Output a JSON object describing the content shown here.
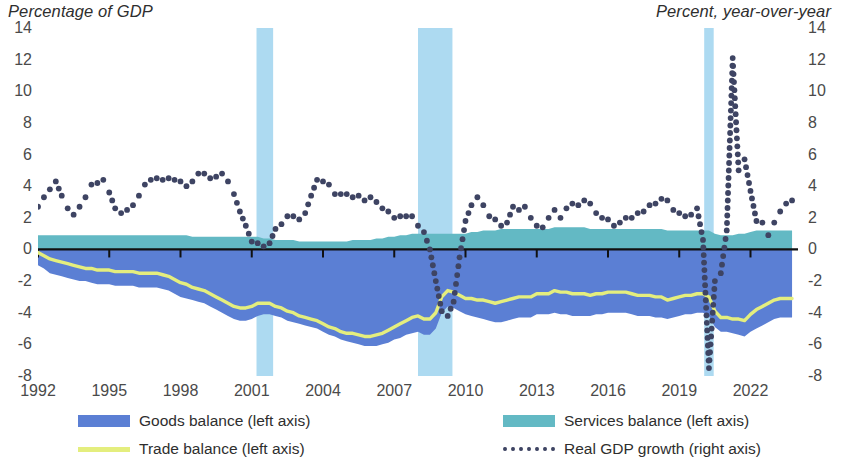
{
  "header": {
    "left_title": "Percentage of GDP",
    "right_title": "Percent, year-over-year"
  },
  "colors": {
    "goods": "#5b7fd4",
    "services": "#63b9c4",
    "trade_line": "#e4ee7e",
    "gdp_dots": "#3e4463",
    "recession": "#a9d8f0",
    "axis": "#111111",
    "text": "#4a4a4a"
  },
  "legend": {
    "items": [
      {
        "id": "goods-balance",
        "label": "Goods balance (left axis)",
        "swatch": "fill",
        "color": "#5b7fd4"
      },
      {
        "id": "trade-balance",
        "label": "Trade balance (left axis)",
        "swatch": "line",
        "color": "#e4ee7e"
      },
      {
        "id": "services-balance",
        "label": "Services balance (left axis)",
        "swatch": "fill",
        "color": "#63b9c4"
      },
      {
        "id": "real-gdp-growth",
        "label": "Real GDP growth (right axis)",
        "swatch": "dots",
        "color": "#3e4463"
      }
    ]
  },
  "chart_data": {
    "type": "area",
    "title": "",
    "xlabel": "",
    "ylabel": "Percentage of GDP",
    "ylabel_right": "Percent, year-over-year",
    "xlim": [
      1992,
      2024
    ],
    "ylim": [
      -8,
      14
    ],
    "ylim_right": [
      -8,
      14
    ],
    "yticks": [
      14,
      12,
      10,
      8,
      6,
      4,
      2,
      0,
      -2,
      -4,
      -6,
      -8
    ],
    "yticks_right": [
      14,
      12,
      10,
      8,
      6,
      4,
      2,
      0,
      -2,
      -4,
      -6,
      -8
    ],
    "xticks": [
      1992,
      1995,
      1998,
      2001,
      2004,
      2007,
      2010,
      2013,
      2016,
      2019,
      2022
    ],
    "grid": false,
    "legend_position": "bottom",
    "recession_bands": [
      {
        "start": 2001.2,
        "end": 2001.9
      },
      {
        "start": 2008.0,
        "end": 2009.45
      },
      {
        "start": 2020.05,
        "end": 2020.45
      }
    ],
    "x": [
      1992,
      1992.25,
      1992.5,
      1992.75,
      1993,
      1993.25,
      1993.5,
      1993.75,
      1994,
      1994.25,
      1994.5,
      1994.75,
      1995,
      1995.25,
      1995.5,
      1995.75,
      1996,
      1996.25,
      1996.5,
      1996.75,
      1997,
      1997.25,
      1997.5,
      1997.75,
      1998,
      1998.25,
      1998.5,
      1998.75,
      1999,
      1999.25,
      1999.5,
      1999.75,
      2000,
      2000.25,
      2000.5,
      2000.75,
      2001,
      2001.25,
      2001.5,
      2001.75,
      2002,
      2002.25,
      2002.5,
      2002.75,
      2003,
      2003.25,
      2003.5,
      2003.75,
      2004,
      2004.25,
      2004.5,
      2004.75,
      2005,
      2005.25,
      2005.5,
      2005.75,
      2006,
      2006.25,
      2006.5,
      2006.75,
      2007,
      2007.25,
      2007.5,
      2007.75,
      2008,
      2008.25,
      2008.5,
      2008.75,
      2009,
      2009.25,
      2009.5,
      2009.75,
      2010,
      2010.25,
      2010.5,
      2010.75,
      2011,
      2011.25,
      2011.5,
      2011.75,
      2012,
      2012.25,
      2012.5,
      2012.75,
      2013,
      2013.25,
      2013.5,
      2013.75,
      2014,
      2014.25,
      2014.5,
      2014.75,
      2015,
      2015.25,
      2015.5,
      2015.75,
      2016,
      2016.25,
      2016.5,
      2016.75,
      2017,
      2017.25,
      2017.5,
      2017.75,
      2018,
      2018.25,
      2018.5,
      2018.75,
      2019,
      2019.25,
      2019.5,
      2019.75,
      2020,
      2020.25,
      2020.5,
      2020.75,
      2021,
      2021.25,
      2021.5,
      2021.75,
      2022,
      2022.25,
      2022.5,
      2022.75,
      2023,
      2023.25,
      2023.5,
      2023.75
    ],
    "series": [
      {
        "name": "Goods balance (left axis)",
        "axis": "left",
        "type": "area",
        "color": "#5b7fd4",
        "values": [
          -1.0,
          -1.2,
          -1.5,
          -1.6,
          -1.7,
          -1.8,
          -1.9,
          -2.0,
          -2.0,
          -2.1,
          -2.2,
          -2.2,
          -2.2,
          -2.3,
          -2.3,
          -2.3,
          -2.3,
          -2.4,
          -2.4,
          -2.4,
          -2.4,
          -2.5,
          -2.6,
          -2.8,
          -3.0,
          -3.1,
          -3.2,
          -3.3,
          -3.4,
          -3.6,
          -3.8,
          -4.0,
          -4.2,
          -4.4,
          -4.5,
          -4.5,
          -4.4,
          -4.2,
          -4.1,
          -4.1,
          -4.2,
          -4.3,
          -4.5,
          -4.6,
          -4.7,
          -4.8,
          -4.9,
          -5.0,
          -5.2,
          -5.4,
          -5.5,
          -5.7,
          -5.8,
          -5.9,
          -6.0,
          -6.1,
          -6.1,
          -6.1,
          -6.0,
          -5.9,
          -5.7,
          -5.6,
          -5.4,
          -5.3,
          -5.2,
          -5.4,
          -5.4,
          -5.0,
          -4.0,
          -3.6,
          -3.7,
          -3.9,
          -4.1,
          -4.2,
          -4.3,
          -4.4,
          -4.5,
          -4.6,
          -4.6,
          -4.5,
          -4.4,
          -4.3,
          -4.3,
          -4.3,
          -4.1,
          -4.1,
          -4.1,
          -4.0,
          -4.1,
          -4.1,
          -4.2,
          -4.2,
          -4.2,
          -4.2,
          -4.1,
          -4.1,
          -4.0,
          -4.0,
          -4.0,
          -4.0,
          -4.1,
          -4.2,
          -4.2,
          -4.2,
          -4.3,
          -4.3,
          -4.4,
          -4.3,
          -4.2,
          -4.1,
          -4.1,
          -4.0,
          -4.0,
          -4.2,
          -4.9,
          -5.2,
          -5.2,
          -5.3,
          -5.4,
          -5.5,
          -5.2,
          -5.0,
          -4.8,
          -4.6,
          -4.4,
          -4.3,
          -4.3,
          -4.3
        ]
      },
      {
        "name": "Services balance (left axis)",
        "axis": "left",
        "type": "area",
        "color": "#63b9c4",
        "values": [
          0.9,
          0.9,
          0.9,
          0.9,
          0.9,
          0.9,
          0.9,
          0.9,
          0.9,
          0.9,
          0.9,
          0.9,
          0.9,
          0.9,
          0.9,
          0.9,
          0.9,
          0.9,
          0.9,
          0.9,
          0.9,
          0.9,
          0.9,
          0.9,
          0.9,
          0.9,
          0.8,
          0.8,
          0.8,
          0.8,
          0.8,
          0.8,
          0.8,
          0.8,
          0.8,
          0.8,
          0.8,
          0.8,
          0.7,
          0.7,
          0.6,
          0.6,
          0.6,
          0.6,
          0.5,
          0.5,
          0.5,
          0.5,
          0.5,
          0.5,
          0.5,
          0.5,
          0.5,
          0.6,
          0.6,
          0.6,
          0.6,
          0.7,
          0.7,
          0.8,
          0.8,
          0.9,
          0.9,
          1.0,
          1.0,
          1.0,
          1.0,
          1.0,
          1.0,
          1.0,
          1.0,
          1.0,
          1.0,
          1.1,
          1.1,
          1.2,
          1.2,
          1.2,
          1.3,
          1.3,
          1.3,
          1.3,
          1.3,
          1.3,
          1.3,
          1.3,
          1.3,
          1.4,
          1.4,
          1.4,
          1.4,
          1.4,
          1.4,
          1.3,
          1.3,
          1.3,
          1.3,
          1.3,
          1.3,
          1.3,
          1.3,
          1.3,
          1.3,
          1.3,
          1.3,
          1.3,
          1.2,
          1.2,
          1.2,
          1.2,
          1.2,
          1.2,
          1.2,
          1.2,
          1.0,
          0.9,
          0.9,
          0.9,
          1.0,
          1.0,
          1.1,
          1.2,
          1.2,
          1.2,
          1.2,
          1.2,
          1.2,
          1.2
        ]
      },
      {
        "name": "Trade balance (left axis)",
        "axis": "left",
        "type": "line",
        "color": "#e4ee7e",
        "values": [
          -0.2,
          -0.4,
          -0.6,
          -0.7,
          -0.8,
          -0.9,
          -1.0,
          -1.1,
          -1.2,
          -1.2,
          -1.3,
          -1.3,
          -1.3,
          -1.4,
          -1.4,
          -1.4,
          -1.4,
          -1.5,
          -1.5,
          -1.5,
          -1.5,
          -1.6,
          -1.7,
          -1.9,
          -2.1,
          -2.2,
          -2.4,
          -2.5,
          -2.6,
          -2.8,
          -3.0,
          -3.2,
          -3.4,
          -3.6,
          -3.7,
          -3.7,
          -3.6,
          -3.4,
          -3.4,
          -3.4,
          -3.6,
          -3.7,
          -3.9,
          -4.0,
          -4.2,
          -4.3,
          -4.4,
          -4.5,
          -4.7,
          -4.9,
          -5.0,
          -5.2,
          -5.3,
          -5.3,
          -5.4,
          -5.5,
          -5.5,
          -5.4,
          -5.3,
          -5.1,
          -4.9,
          -4.7,
          -4.5,
          -4.3,
          -4.2,
          -4.4,
          -4.4,
          -4.0,
          -3.0,
          -2.6,
          -2.7,
          -2.9,
          -3.1,
          -3.1,
          -3.2,
          -3.2,
          -3.3,
          -3.4,
          -3.3,
          -3.2,
          -3.1,
          -3.0,
          -3.0,
          -3.0,
          -2.8,
          -2.8,
          -2.8,
          -2.6,
          -2.7,
          -2.7,
          -2.8,
          -2.8,
          -2.8,
          -2.9,
          -2.8,
          -2.8,
          -2.7,
          -2.7,
          -2.7,
          -2.7,
          -2.8,
          -2.9,
          -2.9,
          -2.9,
          -3.0,
          -3.0,
          -3.2,
          -3.1,
          -3.0,
          -2.9,
          -2.9,
          -2.8,
          -2.8,
          -3.0,
          -3.9,
          -4.3,
          -4.3,
          -4.4,
          -4.4,
          -4.5,
          -4.1,
          -3.8,
          -3.6,
          -3.4,
          -3.2,
          -3.1,
          -3.1,
          -3.1
        ]
      },
      {
        "name": "Real GDP growth (right axis)",
        "axis": "right",
        "type": "scatter-dotted",
        "color": "#3e4463",
        "values": [
          2.7,
          3.3,
          3.8,
          4.3,
          3.4,
          2.6,
          2.2,
          2.7,
          3.3,
          4.1,
          4.2,
          4.4,
          3.6,
          2.6,
          2.3,
          2.5,
          2.8,
          3.4,
          4.1,
          4.4,
          4.5,
          4.4,
          4.5,
          4.4,
          4.3,
          4.0,
          4.3,
          4.8,
          4.8,
          4.5,
          4.6,
          4.8,
          4.3,
          3.5,
          2.4,
          1.5,
          0.5,
          0.4,
          0.2,
          0.4,
          1.3,
          1.6,
          2.1,
          2.1,
          1.9,
          2.3,
          3.4,
          4.4,
          4.3,
          4.1,
          3.5,
          3.5,
          3.5,
          3.3,
          3.4,
          3.1,
          3.3,
          3.0,
          2.6,
          2.4,
          2.0,
          2.1,
          2.1,
          2.1,
          1.5,
          1.1,
          0.0,
          -2.0,
          -3.9,
          -4.2,
          -3.3,
          -0.5,
          1.8,
          2.8,
          3.3,
          2.8,
          2.1,
          1.9,
          1.5,
          1.7,
          2.7,
          2.5,
          2.7,
          2.0,
          1.5,
          1.4,
          2.0,
          2.5,
          2.0,
          2.6,
          2.9,
          2.8,
          3.1,
          2.9,
          2.3,
          2.0,
          1.9,
          1.5,
          1.7,
          2.0,
          2.0,
          2.3,
          2.4,
          2.8,
          2.9,
          3.2,
          3.1,
          2.5,
          2.3,
          2.1,
          2.2,
          2.6,
          0.6,
          -7.5,
          -2.0,
          -1.5,
          1.2,
          12.1,
          5.0,
          5.7,
          3.7,
          1.8,
          1.7,
          0.9,
          1.7,
          2.4,
          2.9,
          3.1
        ]
      }
    ]
  },
  "yaxis_left_labels": [
    "14",
    "12",
    "10",
    "8",
    "6",
    "4",
    "2",
    "0",
    "-2",
    "-4",
    "-6",
    "-8"
  ],
  "yaxis_right_labels": [
    "14",
    "12",
    "10",
    "8",
    "6",
    "4",
    "2",
    "0",
    "-2",
    "-4",
    "-6",
    "-8"
  ],
  "xaxis_labels": [
    "1992",
    "1995",
    "1998",
    "2001",
    "2004",
    "2007",
    "2010",
    "2013",
    "2016",
    "2019",
    "2022"
  ]
}
